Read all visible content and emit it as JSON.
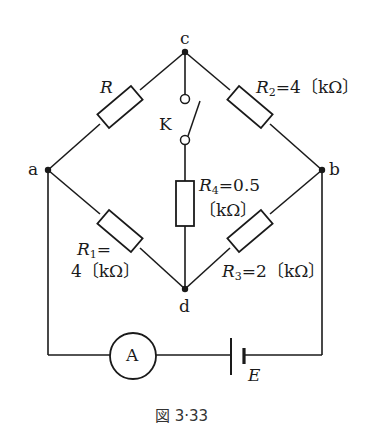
{
  "figure": {
    "caption": "図 3·33",
    "nodes": {
      "a": "a",
      "b": "b",
      "c": "c",
      "d": "d"
    },
    "switch_label": "K",
    "ammeter_label": "A",
    "battery_label": "E",
    "resistors": {
      "R": {
        "sym": "R",
        "sub": "",
        "value": ""
      },
      "R1": {
        "sym": "R",
        "sub": "1",
        "eq": "=",
        "value": "4〔kΩ〕"
      },
      "R2": {
        "sym": "R",
        "sub": "2",
        "eq": "=",
        "value": "4〔kΩ〕"
      },
      "R3": {
        "sym": "R",
        "sub": "3",
        "eq": "=",
        "value": "2〔kΩ〕"
      },
      "R4": {
        "sym": "R",
        "sub": "4",
        "eq": "=",
        "value_line1": "0.5",
        "value_line2": "〔kΩ〕"
      }
    }
  }
}
